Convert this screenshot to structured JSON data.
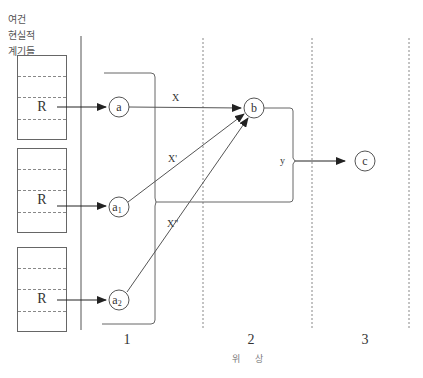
{
  "side_label": {
    "lines": [
      "여건",
      "현실적",
      "계기들"
    ]
  },
  "r_boxes": [
    {
      "label": "R"
    },
    {
      "label": "R"
    },
    {
      "label": "R"
    }
  ],
  "nodes": {
    "a": "a",
    "a1_base": "a",
    "a1_sub": "1",
    "a2_base": "a",
    "a2_sub": "2",
    "b": "b",
    "c": "c"
  },
  "edges": {
    "x": "X",
    "x_prime": "X'",
    "x_double_prime": "X\"",
    "y": "y"
  },
  "phases": {
    "p1": "1",
    "p2": "2",
    "p3": "3",
    "axis_label": "위 상"
  },
  "colors": {
    "line": "#555555",
    "dash": "#888888",
    "text": "#333333"
  }
}
